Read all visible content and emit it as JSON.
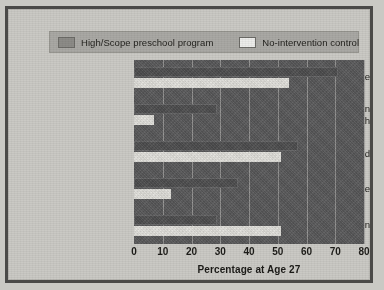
{
  "legend": {
    "entries": [
      {
        "label": "High/Scope preschool program",
        "swatch": "program",
        "color": "#8c8b87"
      },
      {
        "label": "No-intervention control",
        "swatch": "control",
        "color": "#ececea"
      }
    ]
  },
  "axis": {
    "ticks": [
      "0",
      "10",
      "20",
      "30",
      "40",
      "50",
      "60",
      "70",
      "80"
    ],
    "xlabel": "Percentage at Age 27"
  },
  "categories": [
    {
      "label_line1": "High school graduate",
      "label_line2": ""
    },
    {
      "label_line1": "Earning more than",
      "label_line2": "$2,000/month"
    },
    {
      "label_line1": "Married",
      "label_line2": ""
    },
    {
      "label_line1": "Own own home",
      "label_line2": ""
    },
    {
      "label_line1": "Spent time in prison",
      "label_line2": ""
    }
  ],
  "chart_data": {
    "type": "bar",
    "orientation": "horizontal",
    "title": "",
    "xlabel": "Percentage at Age 27",
    "ylabel": "",
    "xlim": [
      0,
      80
    ],
    "xticks": [
      0,
      10,
      20,
      30,
      40,
      50,
      60,
      70,
      80
    ],
    "grid": true,
    "legend_position": "top",
    "categories": [
      "High school graduate",
      "Earning more than $2,000/month",
      "Married",
      "Own own home",
      "Spent time in prison"
    ],
    "series": [
      {
        "name": "High/Scope preschool program",
        "color": "#4e4e4f",
        "values": [
          71,
          29,
          57,
          36,
          29
        ]
      },
      {
        "name": "No-intervention control",
        "color": "#e3e2dd",
        "values": [
          54,
          7,
          51,
          13,
          51
        ]
      }
    ]
  }
}
